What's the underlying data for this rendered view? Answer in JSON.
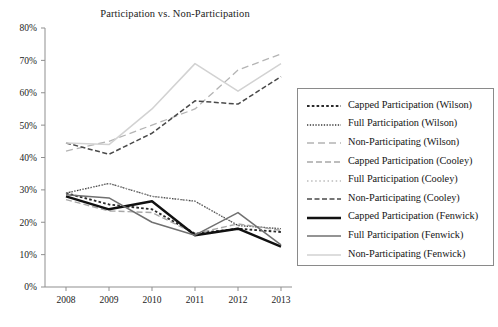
{
  "chart_data": {
    "type": "line",
    "title": "Participation vs. Non-Participation",
    "xlabel": "",
    "ylabel": "",
    "x": [
      "2008",
      "2009",
      "2010",
      "2011",
      "2012",
      "2013"
    ],
    "xlim": [
      2008,
      2013
    ],
    "ylim": [
      0,
      80
    ],
    "ytick_labels": [
      "0%",
      "10%",
      "20%",
      "30%",
      "40%",
      "50%",
      "60%",
      "70%",
      "80%"
    ],
    "ytick_values": [
      0,
      10,
      20,
      30,
      40,
      50,
      60,
      70,
      80
    ],
    "grid": false,
    "legend_position": "right-outside",
    "series": [
      {
        "name": "Capped Participation (Wilson)",
        "values": [
          29,
          25.5,
          24,
          16.5,
          18,
          17
        ],
        "color": "#2b2b2b",
        "style": "dotted-heavy",
        "width": 1.9,
        "dash": "2.6,2.2"
      },
      {
        "name": "Full Participation (Wilson)",
        "values": [
          29,
          32,
          28,
          26.5,
          19,
          18
        ],
        "color": "#3a3a3a",
        "style": "dotted-fine",
        "width": 1.3,
        "dash": "1.3,1.5"
      },
      {
        "name": "Non-Participating (Wilson)",
        "values": [
          42,
          45,
          50,
          55,
          67,
          72
        ],
        "color": "#b4b4b4",
        "style": "long-dash",
        "width": 1.3,
        "dash": "7,4"
      },
      {
        "name": "Capped Participation (Cooley)",
        "values": [
          27,
          23.5,
          23,
          16.5,
          19.5,
          17.5
        ],
        "color": "#a8a8a8",
        "style": "dash-dot-long",
        "width": 1.4,
        "dash": "6,3"
      },
      {
        "name": "Full Participation (Cooley)",
        "values": [
          29,
          32,
          28,
          26.5,
          19,
          18
        ],
        "color": "#9a9a9a",
        "style": "dotted-sparse",
        "width": 1.2,
        "dash": "1.5,2.6"
      },
      {
        "name": "Non-Participating (Cooley)",
        "values": [
          44.5,
          41,
          47.5,
          57.5,
          56.5,
          65
        ],
        "color": "#4a4a4a",
        "style": "dash-dot",
        "width": 1.5,
        "dash": "5,2.5"
      },
      {
        "name": "Capped Participation (Fenwick)",
        "values": [
          28,
          24,
          26.5,
          16,
          18,
          12.5
        ],
        "color": "#111111",
        "style": "solid-bold",
        "width": 2.4,
        "dash": "none"
      },
      {
        "name": "Full Participation (Fenwick)",
        "values": [
          28.5,
          27.5,
          20,
          16,
          23,
          13
        ],
        "color": "#707070",
        "style": "solid",
        "width": 1.5,
        "dash": "none"
      },
      {
        "name": "Non-Participating (Fenwick)",
        "values": [
          44.5,
          44,
          55,
          69,
          60.5,
          69
        ],
        "color": "#d2d2d2",
        "style": "solid-light",
        "width": 1.5,
        "dash": "none"
      }
    ]
  },
  "axes": {
    "y_ticks": [
      "80%",
      "70%",
      "60%",
      "50%",
      "40%",
      "30%",
      "20%",
      "10%",
      "0%"
    ],
    "x_ticks": [
      "2008",
      "2009",
      "2010",
      "2011",
      "2012",
      "2013"
    ]
  },
  "legend": {
    "items": [
      {
        "label": "Capped Participation (Wilson)"
      },
      {
        "label": "Full Participation (Wilson)"
      },
      {
        "label": "Non-Participating (Wilson)"
      },
      {
        "label": "Capped Participation (Cooley)"
      },
      {
        "label": "Full Participation (Cooley)"
      },
      {
        "label": "Non-Participating (Cooley)"
      },
      {
        "label": "Capped Participation (Fenwick)"
      },
      {
        "label": "Full Participation (Fenwick)"
      },
      {
        "label": "Non-Participating (Fenwick)"
      }
    ]
  }
}
